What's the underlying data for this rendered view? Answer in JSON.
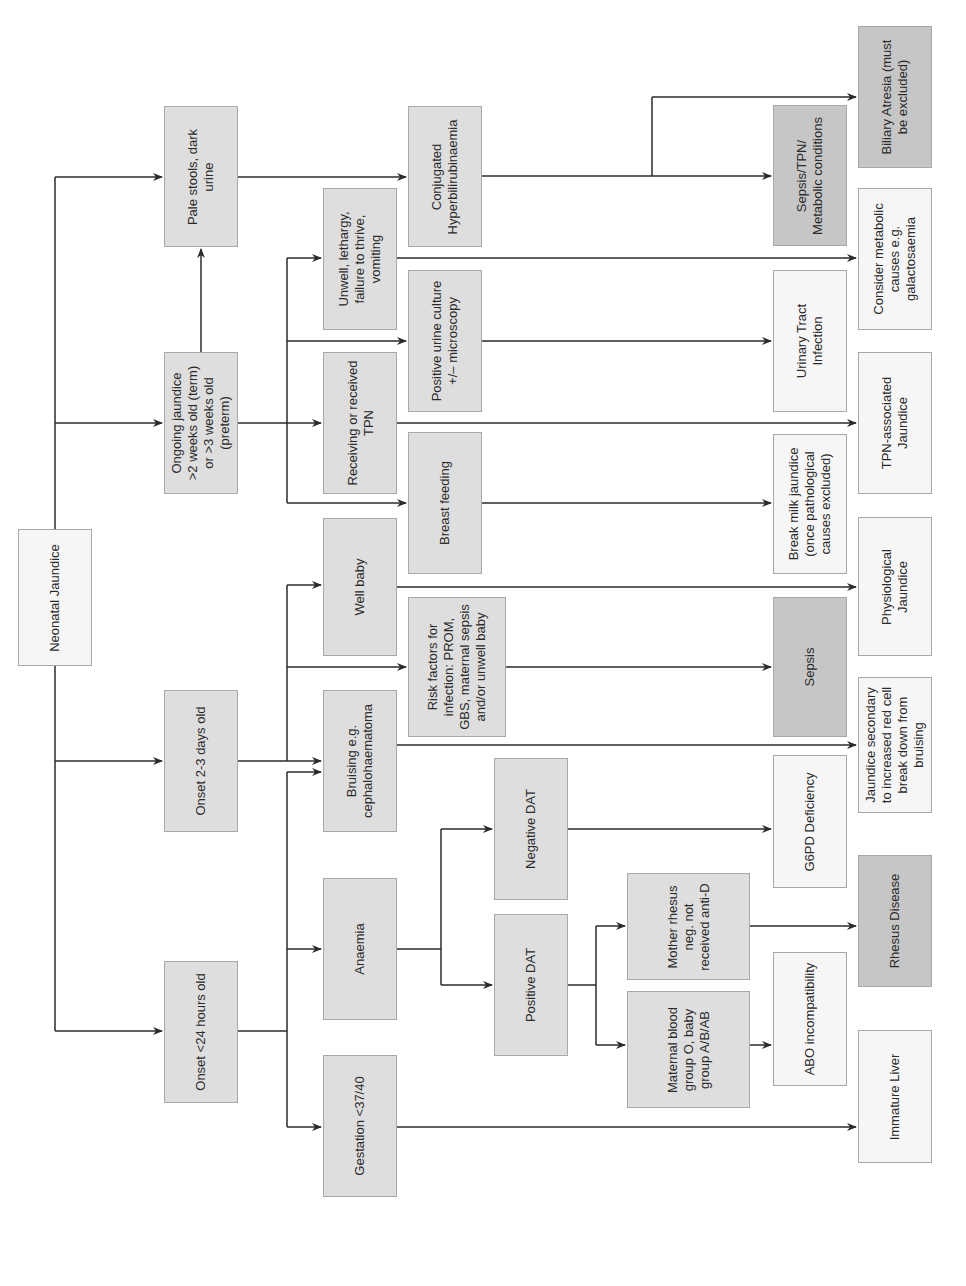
{
  "title": "Neonatal Jaundice",
  "colors": {
    "line": "#2b2b2b",
    "box_border": "#a8a8a8",
    "fill_white": "#f6f6f6",
    "fill_light": "#ececec",
    "fill_mid": "#dedede",
    "fill_dark": "#c6c6c6"
  },
  "nodes": {
    "root": "Neonatal Jaundice",
    "onset_24h": "Onset <24 hours old",
    "onset_2_3d": "Onset 2-3 days old",
    "ongoing": "Ongoing jaundice\n>2 weeks old (term)\nor >3 weeks old\n(preterm)",
    "pale_stools": "Pale stools, dark\nurine",
    "gestation": "Gestation <37/40",
    "anaemia": "Anaemia",
    "bruising": "Bruising e.g.\ncephalohaematoma",
    "well_baby": "Well baby",
    "receiving_tpn": "Receiving or received\nTPN",
    "unwell": "Unwell, lethargy,\nfailure to thrive,\nvomiting",
    "risk_factors": "Risk factors for\ninfection: PROM,\nGBS, maternal sepsis\nand/or unwell baby",
    "breast_feeding": "Breast feeding",
    "positive_urine": "Positive urine culture\n+/– microscopy",
    "conjugated": "Conjugated\nHyperbilirubinaemia",
    "positive_dat": "Positive DAT",
    "negative_dat": "Negative DAT",
    "maternal_blood": "Maternal blood\ngroup O, baby\ngroup A/B/AB",
    "mother_rhesus": "Mother rhesus\nneg. not\nreceived anti-D",
    "uti": "Urinary Tract\nInfection",
    "break_milk": "Break milk jaundice\n(once pathological\ncauses excluded)",
    "sepsis": "Sepsis",
    "g6pd": "G6PD Deficiency",
    "abo": "ABO incompatibility",
    "sepsis_tpn": "Sepsis/TPN/\nMetabolic conditions",
    "biliary": "Biliary Atresia (must\nbe excluded)",
    "metabolic": "Consider metabolic\ncauses e.g.\ngalactosaemia",
    "tpn_jaundice": "TPN-associated\nJaundice",
    "physiological": "Physiological\nJaundice",
    "bruising_jaundice": "Jaundice secondary\nto increased red cell\nbreak down from\nbruising",
    "rhesus": "Rhesus Disease",
    "immature_liver": "Immature Liver"
  }
}
